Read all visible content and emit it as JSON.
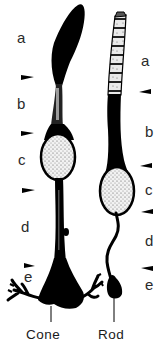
{
  "diagram": {
    "cells": [
      {
        "name": "Cone",
        "caption": "Cone",
        "segment_labels": [
          "a",
          "b",
          "c",
          "d",
          "e"
        ]
      },
      {
        "name": "Rod",
        "caption": "Rod",
        "segment_labels": [
          "a",
          "b",
          "c",
          "d",
          "e"
        ]
      }
    ],
    "colors": {
      "ink": "#000000",
      "background": "#ffffff",
      "label": "#2a2a2a"
    }
  }
}
